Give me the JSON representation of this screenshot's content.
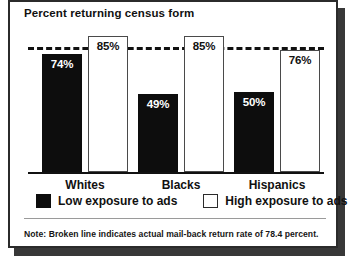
{
  "figure": {
    "title": "Percent returning census form",
    "note": "Note: Broken line indicates actual mail-back return rate of 78.4 percent."
  },
  "legend": {
    "items": [
      {
        "key": "low",
        "label": "Low exposure to ads",
        "color": "#0d0d0d"
      },
      {
        "key": "high",
        "label": "High exposure to ads",
        "color": "#ffffff"
      }
    ]
  },
  "chart_data": {
    "type": "bar",
    "title": "Percent returning census form",
    "xlabel": "",
    "ylabel": "Percent returning census form",
    "ylim": [
      0,
      100
    ],
    "grid": false,
    "legend_position": "bottom",
    "categories": [
      "Whites",
      "Blacks",
      "Hispanics"
    ],
    "series": [
      {
        "name": "Low exposure to ads",
        "values": [
          74,
          49,
          50
        ],
        "labels": [
          "74%",
          "49%",
          "50%"
        ],
        "color": "#0d0d0d"
      },
      {
        "name": "High exposure to ads",
        "values": [
          85,
          85,
          76
        ],
        "labels": [
          "85%",
          "85%",
          "76%"
        ],
        "color": "#ffffff"
      }
    ],
    "annotations": [
      {
        "type": "reference-line",
        "style": "dashed",
        "value": 78.4,
        "label": "actual mail-back return rate of 78.4 percent"
      }
    ]
  }
}
